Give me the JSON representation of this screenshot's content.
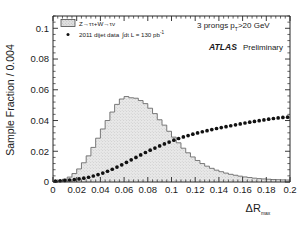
{
  "figure": {
    "background": "#ffffff",
    "frame_color": "#262626"
  },
  "axes": {
    "y_title": "Sample Fraction / 0.004",
    "x_title_main": "R",
    "x_title_prefix": "Δ",
    "x_title_sub": "max",
    "x_ticklabels": [
      "0",
      "0.02",
      "0.04",
      "0.06",
      "0.08",
      "0.1",
      "0.12",
      "0.14",
      "0.16",
      "0.18",
      "0.2"
    ],
    "y_ticklabels": [
      "0",
      "0.02",
      "0.04",
      "0.06",
      "0.08",
      "0.1"
    ]
  },
  "legend": {
    "entry1_label": "Z→ττ+W→τν",
    "entry2_prefix": "2011 dijet data",
    "entry2_integral": "∫dt L = 130 pb",
    "entry2_exponent": "-1"
  },
  "annotations": {
    "prongs_pre": "3 prongs p",
    "prongs_sub": "T",
    "prongs_post": ">20 GeV",
    "experiment": "ATLAS",
    "status": "Preliminary"
  },
  "chart_data": {
    "type": "line",
    "title": "",
    "xlabel": "ΔR_max",
    "ylabel": "Sample Fraction / 0.004",
    "xlim": [
      0,
      0.2
    ],
    "ylim": [
      0,
      0.108
    ],
    "grid": false,
    "legend_position": "top-left",
    "bin_width": 0.004,
    "x": [
      0.002,
      0.006,
      0.01,
      0.014,
      0.018,
      0.022,
      0.026,
      0.03,
      0.034,
      0.038,
      0.042,
      0.046,
      0.05,
      0.054,
      0.058,
      0.062,
      0.066,
      0.07,
      0.074,
      0.078,
      0.082,
      0.086,
      0.09,
      0.094,
      0.098,
      0.102,
      0.106,
      0.11,
      0.114,
      0.118,
      0.122,
      0.126,
      0.13,
      0.134,
      0.138,
      0.142,
      0.146,
      0.15,
      0.154,
      0.158,
      0.162,
      0.166,
      0.17,
      0.174,
      0.178,
      0.182,
      0.186,
      0.19,
      0.194,
      0.198
    ],
    "series": [
      {
        "name": "Z→ττ+W→τν",
        "style": "histogram-filled",
        "fill": "hatched-grey",
        "values": [
          0.0003,
          0.0008,
          0.0018,
          0.0032,
          0.0055,
          0.0085,
          0.0125,
          0.017,
          0.0225,
          0.0285,
          0.0345,
          0.04,
          0.0455,
          0.0505,
          0.054,
          0.0556,
          0.0548,
          0.0545,
          0.053,
          0.051,
          0.048,
          0.0445,
          0.0405,
          0.037,
          0.033,
          0.0292,
          0.0255,
          0.022,
          0.019,
          0.0163,
          0.014,
          0.012,
          0.0103,
          0.0089,
          0.0077,
          0.0067,
          0.0058,
          0.005,
          0.0044,
          0.0038,
          0.0033,
          0.0029,
          0.0025,
          0.0022,
          0.002,
          0.0018,
          0.0016,
          0.0015,
          0.0014,
          0.0013
        ]
      },
      {
        "name": "2011 dijet data",
        "style": "markers",
        "marker": "filled-circle",
        "values": [
          0.0006,
          0.0008,
          0.001,
          0.0013,
          0.0016,
          0.002,
          0.0025,
          0.0031,
          0.0039,
          0.0048,
          0.0058,
          0.007,
          0.0083,
          0.0097,
          0.0112,
          0.0128,
          0.0144,
          0.016,
          0.0176,
          0.0192,
          0.0207,
          0.0221,
          0.0235,
          0.0248,
          0.026,
          0.0272,
          0.0283,
          0.0293,
          0.0302,
          0.0311,
          0.0319,
          0.0327,
          0.0334,
          0.0341,
          0.0348,
          0.0354,
          0.036,
          0.0366,
          0.0372,
          0.0378,
          0.0384,
          0.0389,
          0.0394,
          0.0399,
          0.0404,
          0.0409,
          0.0413,
          0.0417,
          0.042,
          0.0422
        ]
      }
    ]
  }
}
